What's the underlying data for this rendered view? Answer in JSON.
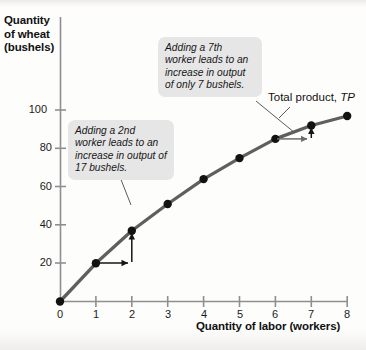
{
  "chart_data": {
    "type": "line",
    "title": "",
    "xlabel": "Quantity of labor (workers)",
    "ylabel": "Quantity of wheat (bushels)",
    "xlim": [
      0,
      8.45
    ],
    "ylim": [
      0,
      112
    ],
    "grid": false,
    "legend_position": "inline-curve-label",
    "x": [
      0,
      1,
      2,
      3,
      4,
      5,
      6,
      7,
      8
    ],
    "series": [
      {
        "name": "Total product, TP",
        "values": [
          0,
          20,
          37,
          51,
          64,
          75,
          85,
          92,
          97
        ]
      }
    ],
    "xticks": [
      0,
      1,
      2,
      3,
      4,
      5,
      6,
      7,
      8
    ],
    "xtick_labels": [
      "0",
      "1",
      "2",
      "3",
      "4",
      "5",
      "6",
      "7",
      "8"
    ],
    "yticks": [
      20,
      40,
      60,
      80,
      100
    ],
    "ytick_labels": [
      "20",
      "40",
      "60",
      "80",
      "100"
    ],
    "annotations": [
      {
        "id": "marginal-product-2nd-worker",
        "text": "Adding a 2nd worker leads to an increase in output of 17 bushels.",
        "from_point": [
          1,
          20
        ],
        "to_point": [
          2,
          37
        ],
        "delta": 17
      },
      {
        "id": "marginal-product-7th-worker",
        "text": "Adding a 7th worker leads to an increase in output of only 7 bushels.",
        "from_point": [
          6,
          85
        ],
        "to_point": [
          7,
          92
        ],
        "delta": 7
      }
    ],
    "colors": {
      "curve": "#595959",
      "point": "#111111",
      "axis": "#8a8a8a",
      "callout_bg": "#e6e6e6",
      "text": "#111111",
      "background": "#fdfdfc"
    }
  },
  "axes": {
    "y_title_lines": [
      "Quantity",
      "of wheat",
      "(bushels)"
    ],
    "y_title_text": "Quantity of wheat (bushels)",
    "x_title_text": "Quantity of labor (workers)"
  },
  "curve_label": {
    "prefix": "Total product, ",
    "symbol": "TP"
  },
  "callouts": {
    "second_worker": "Adding a 2nd worker leads to an increase in output of 17 bushels.",
    "seventh_worker": "Adding a 7th worker leads to an increase in output of only 7 bushels."
  }
}
